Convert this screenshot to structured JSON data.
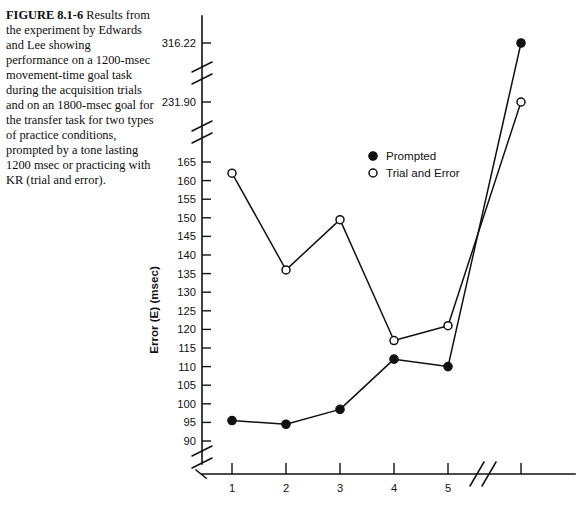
{
  "caption": {
    "figure_number": "FIGURE 8.1-6",
    "text": "Results from the experiment by Edwards and Lee showing performance on a 1200-msec movement-time goal task during the acquisition trials and on an 1800-msec goal for the transfer task for two types of practice conditions, prompted by a tone lasting 1200 msec or practicing with KR (trial and error)."
  },
  "legend": {
    "position": "top-right-inside",
    "items": [
      {
        "marker": "filled-circle",
        "label": "Prompted"
      },
      {
        "marker": "open-circle",
        "label": "Trial and Error"
      }
    ]
  },
  "chart_data": {
    "type": "line",
    "title": "",
    "xlabel": "",
    "ylabel": "Error (E) (msec)",
    "grid": false,
    "x": [
      1,
      2,
      3,
      4,
      5,
      6
    ],
    "x_tick_labels": [
      "1",
      "2",
      "3",
      "4",
      "5",
      ""
    ],
    "x_axis_break_after": 5,
    "y_tick_labels": [
      "90",
      "95",
      "100",
      "105",
      "110",
      "115",
      "120",
      "125",
      "130",
      "135",
      "140",
      "145",
      "150",
      "155",
      "160",
      "165",
      "231.90",
      "316.22"
    ],
    "y_axis_breaks": [
      "below-90",
      "between-165-and-231.90",
      "between-231.90-and-316.22"
    ],
    "ylim": [
      88,
      320
    ],
    "series": [
      {
        "name": "Prompted",
        "marker": "filled-circle",
        "values": [
          95.5,
          94.5,
          98.5,
          112,
          110,
          316.22
        ]
      },
      {
        "name": "Trial and Error",
        "marker": "open-circle",
        "values": [
          162,
          136,
          149.5,
          117,
          121,
          231.9
        ]
      }
    ],
    "annotations": [
      "Trials 1-5 are acquisition trials (1200-msec goal)",
      "Final unlabeled point is the transfer task (1800-msec goal)"
    ]
  }
}
